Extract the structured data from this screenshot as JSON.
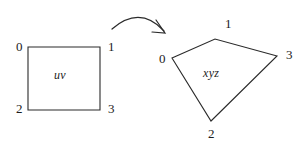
{
  "figure": {
    "background_color": "#ffffff",
    "stroke_color": "#2a2a2a",
    "text_color": "#1c1c1c",
    "source_shape": {
      "name": "uv",
      "type": "square",
      "vertices": [
        {
          "index": "0",
          "x": 28,
          "y": 47
        },
        {
          "index": "1",
          "x": 100,
          "y": 47
        },
        {
          "index": "2",
          "x": 28,
          "y": 110
        },
        {
          "index": "3",
          "x": 100,
          "y": 110
        }
      ],
      "outline_path": "M 28 47 L 100 47 L 100 110 L 28 110 Z"
    },
    "target_shape": {
      "name": "xyz",
      "type": "quadrilateral",
      "vertices": [
        {
          "index": "0",
          "x": 172,
          "y": 58
        },
        {
          "index": "1",
          "x": 215,
          "y": 39
        },
        {
          "index": "2",
          "x": 211,
          "y": 121
        },
        {
          "index": "3",
          "x": 277,
          "y": 56
        }
      ],
      "outline_path": "M 172 58 L 215 39 L 277 56 L 211 121 Z"
    },
    "arrow": {
      "name": "mapping-arrow",
      "direction": "left-to-right",
      "curve_path": "M 112 29 Q 140 5 164 31",
      "head_path": "M 156 20 L 165 33 L 152 32"
    }
  }
}
